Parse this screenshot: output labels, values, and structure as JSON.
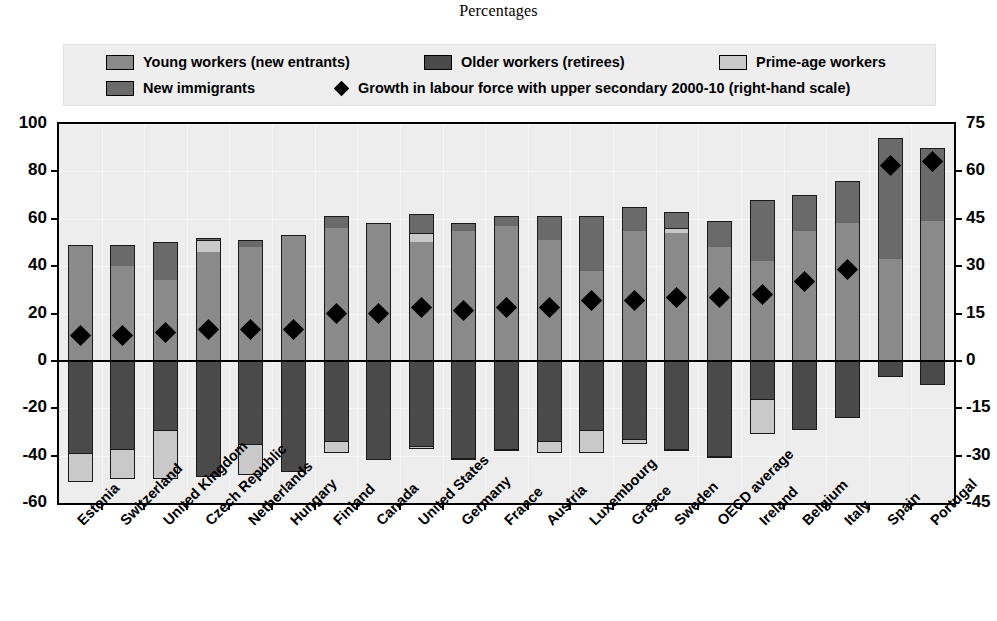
{
  "title": "Percentages",
  "legend": {
    "items": [
      {
        "label": "Young workers (new entrants)",
        "key": "young",
        "color": "#8a8a8a",
        "icon": "swatch-icon"
      },
      {
        "label": "Older workers (retirees)",
        "key": "older",
        "color": "#4a4a4a",
        "icon": "swatch-icon"
      },
      {
        "label": "Prime-age workers",
        "key": "prime",
        "color": "#c9c9c9",
        "icon": "swatch-icon"
      },
      {
        "label": "New immigrants",
        "key": "immigrants",
        "color": "#6a6a6a",
        "icon": "swatch-icon"
      },
      {
        "label": "Growth in labour force with upper secondary 2000-10 (right-hand scale)",
        "key": "growth",
        "color": "#000000",
        "icon": "diamond-marker-icon"
      }
    ]
  },
  "chart_data": {
    "type": "bar",
    "title": "Percentages",
    "xlabel": "",
    "ylabel": "",
    "ylim": [
      -60,
      100
    ],
    "yticks": [
      100,
      80,
      60,
      40,
      20,
      0,
      -20,
      -40,
      -60
    ],
    "y2lim": [
      -45,
      75
    ],
    "y2ticks": [
      75,
      60,
      45,
      30,
      15,
      0,
      -15,
      -30,
      -45
    ],
    "grid": true,
    "legend_position": "top",
    "stacked": true,
    "categories": [
      "Estonia",
      "Switzerland",
      "United Kingdom",
      "Czech Republic",
      "Netherlands",
      "Hungary",
      "Finland",
      "Canada",
      "United States",
      "Germany",
      "France",
      "Austria",
      "Luxembourg",
      "Greece",
      "Sweden",
      "OECD average",
      "Ireland",
      "Belgium",
      "Italy",
      "Spain",
      "Portugal"
    ],
    "emphasis_category": "OECD average",
    "series": [
      {
        "name": "Young workers (new entrants)",
        "key": "young",
        "color": "#8a8a8a",
        "values": [
          49,
          40,
          34,
          46,
          48,
          53,
          56,
          58,
          50,
          55,
          57,
          51,
          38,
          55,
          54,
          48,
          42,
          55,
          58,
          43,
          59
        ]
      },
      {
        "name": "New immigrants",
        "key": "immigrants",
        "color": "#6a6a6a",
        "values": [
          0,
          9,
          16,
          1,
          3,
          0,
          5,
          0,
          8,
          3,
          4,
          10,
          23,
          10,
          7,
          11,
          26,
          15,
          18,
          51,
          31
        ]
      },
      {
        "name": "Prime-age workers",
        "key": "prime",
        "color": "#c9c9c9",
        "values": [
          0,
          0,
          0,
          5,
          0,
          0,
          0,
          0,
          4,
          0,
          0,
          0,
          0,
          0,
          2,
          0,
          0,
          0,
          0,
          0,
          0
        ]
      },
      {
        "name": "Older workers (retirees)",
        "key": "older",
        "color": "#4a4a4a",
        "values": [
          -39,
          -37,
          -29,
          -49,
          -35,
          -47,
          -34,
          -42,
          -36,
          -41,
          -37,
          -34,
          -29,
          -33,
          -37,
          -40,
          -16,
          -29,
          -24,
          -7,
          -10
        ]
      },
      {
        "name": "Prime-age workers (negative)",
        "key": "prime_neg",
        "color": "#c9c9c9",
        "values": [
          -12,
          -13,
          -21,
          0,
          -13,
          0,
          -5,
          0,
          -1,
          -1,
          -1,
          -5,
          -10,
          -2,
          -1,
          -1,
          -15,
          0,
          0,
          0,
          0
        ]
      }
    ],
    "marker_series": {
      "name": "Growth in labour force with upper secondary 2000-10 (right-hand scale)",
      "key": "growth",
      "color": "#000000",
      "axis": "right",
      "values": [
        8,
        8,
        9,
        10,
        10,
        10,
        15,
        15,
        17,
        16,
        17,
        17,
        19,
        19,
        20,
        20,
        21,
        25,
        29,
        62,
        63
      ]
    }
  },
  "axes": {
    "left_labels": [
      "100",
      "80",
      "60",
      "40",
      "20",
      "0",
      "-20",
      "-40",
      "-60"
    ],
    "right_labels": [
      "75",
      "60",
      "45",
      "30",
      "15",
      "0",
      "-15",
      "-30",
      "-45"
    ]
  }
}
